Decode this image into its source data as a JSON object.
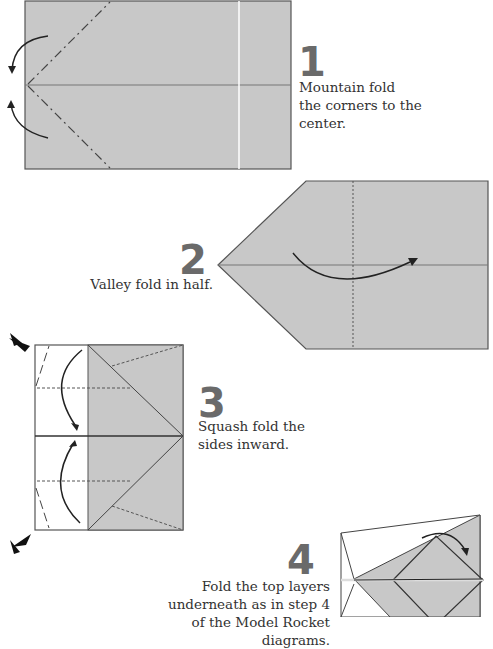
{
  "steps": [
    {
      "number": "1",
      "text_lines": [
        "Mountain fold",
        "the corners to the",
        "center."
      ]
    },
    {
      "number": "2",
      "text_lines": [
        "Valley fold in half."
      ]
    },
    {
      "number": "3",
      "text_lines": [
        "Squash fold the",
        "sides inward."
      ]
    },
    {
      "number": "4",
      "text_lines": [
        "Fold the top layers",
        "underneath as in step 4",
        "of the Model Rocket diagrams."
      ]
    }
  ],
  "colors": {
    "paper": "#c8c8c8",
    "line": "#555555",
    "number": "#6a6a6a"
  }
}
